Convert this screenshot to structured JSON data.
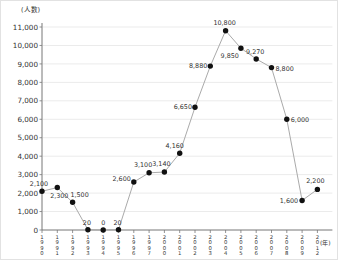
{
  "chart_data": {
    "type": "line",
    "title": "",
    "ylabel": "(人数)",
    "xlabel": "(年)",
    "ylim": [
      0,
      11000
    ],
    "y_tick_step": 1000,
    "grid": true,
    "legend": "none",
    "categories": [
      "1990",
      "1991",
      "1992",
      "1993",
      "1994",
      "1995",
      "1996",
      "1997",
      "2000",
      "2001",
      "2002",
      "2003",
      "2004",
      "2005",
      "2006",
      "2007",
      "2008",
      "2009",
      "2012"
    ],
    "values": [
      2100,
      2300,
      1500,
      20,
      0,
      20,
      2600,
      3100,
      3140,
      4160,
      6650,
      8880,
      10800,
      9850,
      9270,
      8800,
      6000,
      1600,
      2200
    ],
    "point_labels": [
      "2,100",
      "2,300",
      "1,500",
      "20",
      "0",
      "20",
      "2,600",
      "3,100",
      "3,140",
      "4,160",
      "6,650",
      "8,880",
      "10,800",
      "9,850",
      "9,270",
      "8,800",
      "6,000",
      "1,600",
      "2,200"
    ],
    "label_layout": [
      {
        "a": "m",
        "dx": -3,
        "dy": -5
      },
      {
        "a": "m",
        "dx": 2,
        "dy": 10
      },
      {
        "a": "m",
        "dx": 7,
        "dy": -5
      },
      {
        "a": "m",
        "dx": -1,
        "dy": -5
      },
      {
        "a": "m",
        "dx": 0,
        "dy": -5
      },
      {
        "a": "m",
        "dx": -1,
        "dy": -5
      },
      {
        "a": "e",
        "dx": -3,
        "dy": -1
      },
      {
        "a": "m",
        "dx": -6,
        "dy": -6
      },
      {
        "a": "m",
        "dx": -3,
        "dy": -6
      },
      {
        "a": "m",
        "dx": -5,
        "dy": -5
      },
      {
        "a": "e",
        "dx": -3,
        "dy": 2
      },
      {
        "a": "e",
        "dx": -3,
        "dy": 2
      },
      {
        "a": "m",
        "dx": -1,
        "dy": -6
      },
      {
        "a": "e",
        "dx": -2,
        "dy": 10
      },
      {
        "a": "m",
        "dx": -1,
        "dy": -5
      },
      {
        "a": "s",
        "dx": 4,
        "dy": 3
      },
      {
        "a": "s",
        "dx": 4,
        "dy": 3
      },
      {
        "a": "e",
        "dx": -4,
        "dy": 3
      },
      {
        "a": "m",
        "dx": -2,
        "dy": -6
      }
    ],
    "colors": {
      "line": "#aaaaaa",
      "marker": "#111111",
      "grid": "#ebebeb",
      "axis": "#777777",
      "text": "#333333"
    }
  }
}
